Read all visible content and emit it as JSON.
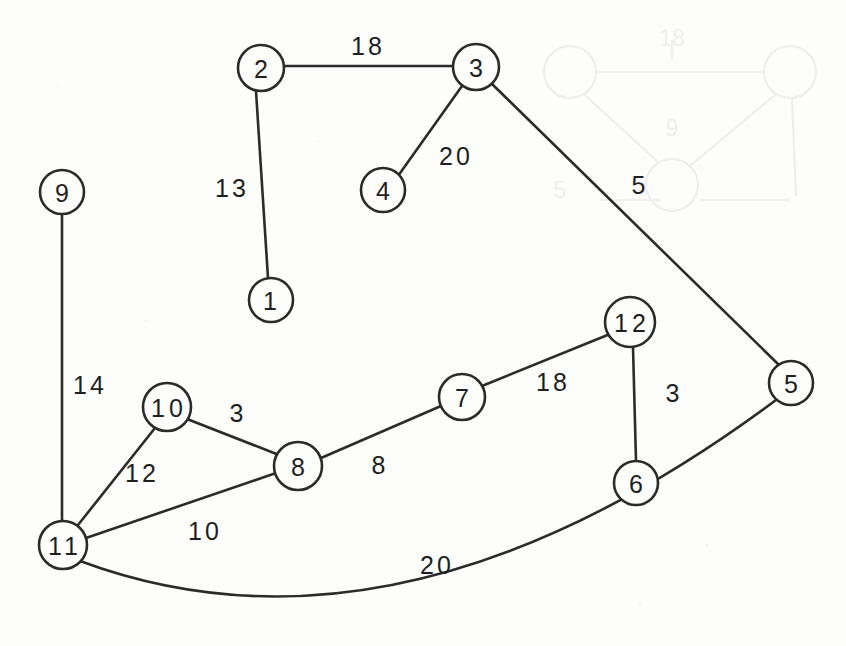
{
  "figure": {
    "background_color": "#fdfdfc",
    "ink_color": "#2b2b2b",
    "width": 846,
    "height": 646
  },
  "graph": {
    "node_count": 12,
    "edge_count": 10,
    "nodes": [
      {
        "id": "n1",
        "label": "1",
        "cx": 271,
        "cy": 300,
        "r": 22
      },
      {
        "id": "n2",
        "label": "2",
        "cx": 261,
        "cy": 68,
        "r": 23
      },
      {
        "id": "n3",
        "label": "3",
        "cx": 476,
        "cy": 67,
        "r": 23
      },
      {
        "id": "n4",
        "label": "4",
        "cx": 383,
        "cy": 190,
        "r": 22
      },
      {
        "id": "n5",
        "label": "5",
        "cx": 791,
        "cy": 383,
        "r": 22
      },
      {
        "id": "n6",
        "label": "6",
        "cx": 636,
        "cy": 483,
        "r": 22
      },
      {
        "id": "n7",
        "label": "7",
        "cx": 462,
        "cy": 397,
        "r": 23
      },
      {
        "id": "n8",
        "label": "8",
        "cx": 298,
        "cy": 466,
        "r": 24
      },
      {
        "id": "n9",
        "label": "9",
        "cx": 62,
        "cy": 192,
        "r": 22
      },
      {
        "id": "n10",
        "label": "10",
        "cx": 167,
        "cy": 407,
        "r": 24
      },
      {
        "id": "n11",
        "label": "11",
        "cx": 63,
        "cy": 545,
        "r": 24
      },
      {
        "id": "n12",
        "label": "12",
        "cx": 630,
        "cy": 322,
        "r": 25
      }
    ],
    "edges": [
      {
        "id": "e2-3",
        "from": "2",
        "to": "3",
        "weight": "18",
        "label_x": 368,
        "label_y": 46,
        "curved": false
      },
      {
        "id": "e2-1",
        "from": "2",
        "to": "1",
        "weight": "13",
        "label_x": 232,
        "label_y": 188,
        "curved": false
      },
      {
        "id": "e3-4",
        "from": "3",
        "to": "4",
        "weight": "20",
        "label_x": 456,
        "label_y": 156,
        "curved": false
      },
      {
        "id": "e3-5",
        "from": "3",
        "to": "5",
        "weight": "5",
        "label_x": 640,
        "label_y": 185,
        "curved": false
      },
      {
        "id": "e9-11",
        "from": "9",
        "to": "11",
        "weight": "14",
        "label_x": 90,
        "label_y": 385,
        "curved": false
      },
      {
        "id": "e10-8",
        "from": "10",
        "to": "8",
        "weight": "3",
        "label_x": 238,
        "label_y": 413,
        "curved": false
      },
      {
        "id": "e10-11",
        "from": "10",
        "to": "11",
        "weight": "12",
        "label_x": 142,
        "label_y": 473,
        "curved": false
      },
      {
        "id": "e11-8",
        "from": "11",
        "to": "8",
        "weight": "10",
        "label_x": 205,
        "label_y": 531,
        "curved": false
      },
      {
        "id": "e8-7",
        "from": "8",
        "to": "7",
        "weight": "8",
        "label_x": 380,
        "label_y": 465,
        "curved": false
      },
      {
        "id": "e7-12",
        "from": "7",
        "to": "12",
        "weight": "18",
        "label_x": 553,
        "label_y": 382,
        "curved": false
      },
      {
        "id": "e12-6",
        "from": "12",
        "to": "6",
        "weight": "3",
        "label_x": 674,
        "label_y": 393,
        "curved": false
      },
      {
        "id": "e11-5",
        "from": "11",
        "to": "5",
        "weight": "20",
        "label_x": 437,
        "label_y": 565,
        "curved": true
      }
    ]
  },
  "ghost": {
    "description": "faint bleed-through of a graph diagram from the reverse side of the scanned page",
    "labels": [
      "18",
      "9",
      "5"
    ]
  }
}
